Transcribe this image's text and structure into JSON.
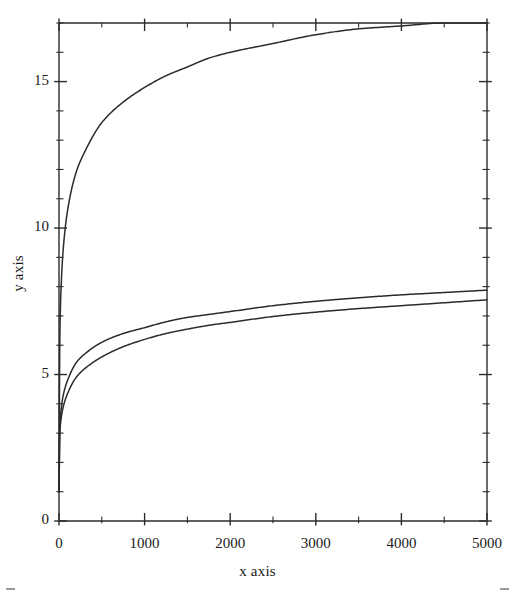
{
  "chart_data": {
    "type": "line",
    "title": "",
    "xlabel": "x axis",
    "ylabel": "y axis",
    "xlim": [
      0,
      5000
    ],
    "ylim": [
      0,
      17
    ],
    "grid": false,
    "legend": null,
    "x_ticks": [
      0,
      1000,
      2000,
      3000,
      4000,
      5000
    ],
    "x_tick_labels": [
      "0",
      "1000",
      "2000",
      "3000",
      "4000",
      "5000"
    ],
    "x_minor_ticks": [
      500,
      1500,
      2500,
      3500,
      4500
    ],
    "y_ticks": [
      0,
      5,
      10,
      15
    ],
    "y_tick_labels": [
      "0",
      "5",
      "10",
      "15"
    ],
    "y_minor_ticks": [
      1,
      2,
      3,
      4,
      6,
      7,
      8,
      9,
      11,
      12,
      13,
      14,
      16,
      17
    ],
    "x": [
      0,
      10,
      25,
      50,
      100,
      200,
      300,
      500,
      750,
      1000,
      1250,
      1500,
      1750,
      2000,
      2500,
      3000,
      3500,
      4000,
      4500,
      5000
    ],
    "series": [
      {
        "name": "upper curve",
        "color": "#2b2b2b",
        "values": [
          1.0,
          6.3,
          8.0,
          9.3,
          10.6,
          11.9,
          12.6,
          13.6,
          14.3,
          14.8,
          15.2,
          15.5,
          15.8,
          16.0,
          16.3,
          16.6,
          16.8,
          16.9,
          17.0,
          17.0
        ]
      },
      {
        "name": "middle curve",
        "color": "#2b2b2b",
        "values": [
          1.0,
          3.2,
          3.8,
          4.3,
          4.8,
          5.4,
          5.7,
          6.1,
          6.4,
          6.6,
          6.8,
          6.95,
          7.05,
          7.15,
          7.35,
          7.5,
          7.62,
          7.72,
          7.8,
          7.88
        ]
      },
      {
        "name": "lower curve",
        "color": "#2b2b2b",
        "values": [
          1.0,
          3.0,
          3.5,
          3.9,
          4.35,
          4.9,
          5.2,
          5.6,
          5.95,
          6.2,
          6.4,
          6.55,
          6.68,
          6.78,
          6.98,
          7.13,
          7.25,
          7.35,
          7.45,
          7.55
        ]
      }
    ]
  }
}
